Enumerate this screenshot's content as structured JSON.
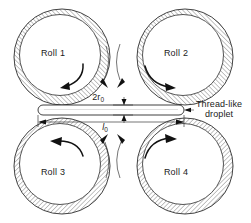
{
  "figure": {
    "title_alt": "Four-roll mill schematic with thread-like droplet",
    "background_color": "#ffffff",
    "line_color": "#2b2b2b",
    "arrow_color": "#111111",
    "hatch_color": "#4a4a4a"
  },
  "rolls": [
    {
      "id": "roll-1",
      "label": "Roll 1",
      "cx": 62,
      "cy": 57,
      "r": 48,
      "label_x": 53,
      "label_y": 56,
      "rotation": "counterclockwise"
    },
    {
      "id": "roll-2",
      "label": "Roll 2",
      "cx": 185,
      "cy": 57,
      "r": 48,
      "label_x": 176,
      "label_y": 56,
      "rotation": "clockwise"
    },
    {
      "id": "roll-3",
      "label": "Roll 3",
      "cx": 62,
      "cy": 166,
      "r": 48,
      "label_x": 53,
      "label_y": 175,
      "rotation": "counterclockwise"
    },
    {
      "id": "roll-4",
      "label": "Roll 4",
      "cx": 185,
      "cy": 166,
      "r": 48,
      "label_x": 176,
      "label_y": 175,
      "rotation": "clockwise"
    }
  ],
  "droplet": {
    "name": "thread-like-droplet",
    "x_left": 38,
    "x_right": 184,
    "y_top": 105,
    "y_bottom": 115,
    "callout_line1": "Thread-like",
    "callout_line2": "droplet",
    "callout_x": 196,
    "callout_y1": 105,
    "callout_y2": 114
  },
  "dimensions": {
    "thickness": {
      "name": "thickness-dimension",
      "symbol": "2r",
      "subscript": "0",
      "label_x": 104,
      "label_y": 99
    },
    "length": {
      "name": "length-dimension",
      "symbol": "l",
      "subscript": "0",
      "label_x": 105,
      "label_y": 128
    }
  }
}
